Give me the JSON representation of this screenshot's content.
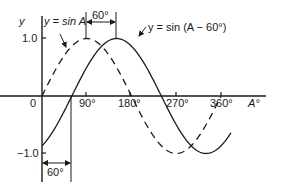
{
  "chart_data": {
    "type": "line",
    "title": "",
    "xlabel": "A°",
    "ylabel": "y",
    "xlim": [
      0,
      420
    ],
    "ylim": [
      -1.0,
      1.0
    ],
    "grid": false,
    "x_ticks": [
      {
        "value": 0,
        "label": "0"
      },
      {
        "value": 90,
        "label": "90°"
      },
      {
        "value": 180,
        "label": "180°"
      },
      {
        "value": 270,
        "label": "270°"
      },
      {
        "value": 360,
        "label": "360°"
      }
    ],
    "y_ticks": [
      {
        "value": 1.0,
        "label": "1.0"
      },
      {
        "value": -1.0,
        "label": "-1.0"
      }
    ],
    "series": [
      {
        "name": "y = sin A",
        "style": "dashed",
        "x_range": [
          0,
          360
        ],
        "phase_deg": 0,
        "x": [
          0,
          30,
          60,
          90,
          120,
          150,
          180,
          210,
          240,
          270,
          300,
          330,
          360
        ],
        "values": [
          0,
          0.5,
          0.866,
          1.0,
          0.866,
          0.5,
          0,
          -0.5,
          -0.866,
          -1.0,
          -0.866,
          -0.5,
          0
        ]
      },
      {
        "name": "y = sin (A − 60°)",
        "style": "solid",
        "x_range": [
          0,
          380
        ],
        "phase_deg": 60,
        "x": [
          0,
          30,
          60,
          90,
          120,
          150,
          180,
          210,
          240,
          270,
          300,
          330,
          360,
          380
        ],
        "values": [
          -0.866,
          -0.5,
          0,
          0.5,
          0.866,
          1.0,
          0.866,
          0.5,
          0,
          -0.5,
          -0.866,
          -1.0,
          -0.866,
          -0.643
        ]
      }
    ],
    "annotations": [
      {
        "text": "y = sin A",
        "points_to": "dashed curve"
      },
      {
        "text": "y = sin (A − 60°)",
        "points_to": "solid curve"
      },
      {
        "text": "60°",
        "type": "dimension",
        "between_deg": [
          90,
          150
        ],
        "position": "top"
      },
      {
        "text": "60°",
        "type": "dimension",
        "between_deg": [
          0,
          60
        ],
        "position": "bottom"
      }
    ]
  },
  "labels": {
    "y_axis": "y",
    "x_axis": "A°",
    "tick_0": "0",
    "tick_90": "90°",
    "tick_180": "180°",
    "tick_270": "270°",
    "tick_360": "360°",
    "y_pos": "1.0",
    "y_neg": "−1.0",
    "legend_sinA": "y = sin A",
    "legend_shift": "y = sin (A − 60°)",
    "dim_top": "60°",
    "dim_bottom": "60°"
  },
  "colors": {
    "ink": "#1a1a1a",
    "background": "#ffffff"
  }
}
